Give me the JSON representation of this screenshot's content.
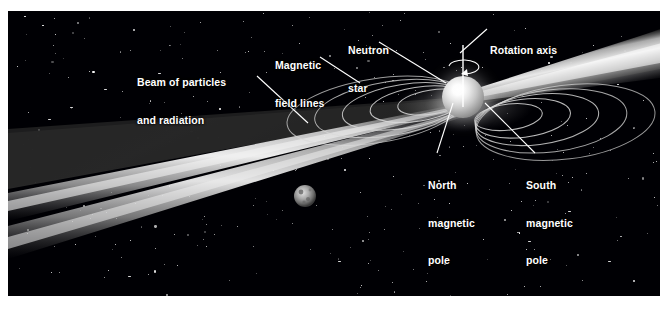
{
  "figure": {
    "background_color": "#000004",
    "border_color": "#ffffff",
    "label_color": "#ffffff"
  },
  "labels": {
    "magnetic_field_lines": {
      "line1": "Magnetic",
      "line2": "field lines"
    },
    "neutron_star": {
      "line1": "Neutron",
      "line2": "star"
    },
    "rotation_axis": {
      "line1": "Rotation axis"
    },
    "beam": {
      "line1": "Beam of particles",
      "line2": "and radiation"
    },
    "north_pole": {
      "line1": "North",
      "line2": "magnetic",
      "line3": "pole"
    },
    "south_pole": {
      "line1": "South",
      "line2": "magnetic",
      "line3": "pole"
    }
  },
  "objects": {
    "neutron_star": {
      "name": "neutron-star",
      "center_x": 463,
      "center_y": 97,
      "radius": 21,
      "color": "#ffffff"
    },
    "planet": {
      "name": "planet-moon",
      "center_x": 305,
      "center_y": 196,
      "radius": 11,
      "color": "#9a9a9a"
    },
    "rotation_arrow": {
      "name": "rotation-arrow",
      "center_x": 468,
      "center_y": 63
    },
    "beam_upper_right": {
      "name": "beam-upper-right",
      "color": "#e6e6e6"
    },
    "beam_lower_left": {
      "name": "beam-lower-left",
      "color": "#e6e6e6"
    },
    "field_lines_left": {
      "name": "magnetic-field-lines-left",
      "count": 5,
      "color": "#d9d9d9"
    },
    "field_lines_right": {
      "name": "magnetic-field-lines-right",
      "count": 5,
      "color": "#d9d9d9"
    }
  }
}
